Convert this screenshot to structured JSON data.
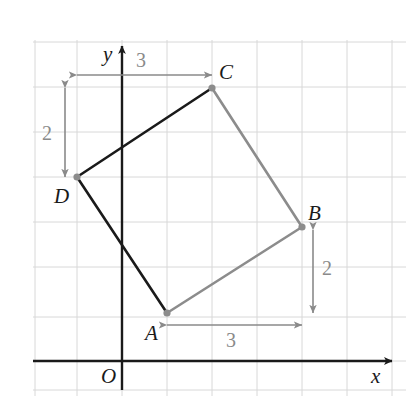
{
  "figure": {
    "background": "#ffffff",
    "width": 406,
    "height": 396
  },
  "axes": {
    "x_label": "x",
    "y_label": "y",
    "origin_label": "O",
    "axis_color": "#1a1a1a",
    "grid_color": "#d8d8d8",
    "origin_px": [
      122,
      361
    ],
    "grid_spacing_px": 45,
    "x_axis_y_px": 361,
    "y_axis_x_px": 122,
    "grid_x_px": [
      35,
      77,
      122,
      167,
      212,
      257,
      302,
      347,
      392
    ],
    "grid_y_px": [
      42,
      87,
      132,
      177,
      222,
      267,
      317,
      361,
      390
    ]
  },
  "chart_data": {
    "type": "scatter",
    "xlabel": "x",
    "ylabel": "y",
    "grid": true,
    "legend": "none",
    "vertices": [
      {
        "name": "A",
        "x": 1,
        "y": 1,
        "px": [
          167,
          313
        ],
        "label_dx": -20,
        "label_dy": 10
      },
      {
        "name": "B",
        "x": 4,
        "y": 3,
        "px": [
          302,
          227
        ],
        "label_dx": 8,
        "label_dy": -26
      },
      {
        "name": "C",
        "x": 2,
        "y": 6,
        "px": [
          212,
          88
        ],
        "label_dx": 8,
        "label_dy": -28
      },
      {
        "name": "D",
        "x": -1,
        "y": 4,
        "px": [
          77,
          177
        ],
        "label_dx": -22,
        "label_dy": 8
      }
    ],
    "edges": [
      {
        "name": "DC",
        "from": "D",
        "to": "C",
        "color": "#1a1a1a",
        "width": 2.6
      },
      {
        "name": "CB",
        "from": "C",
        "to": "B",
        "color": "#8c8c8c",
        "width": 2.6
      },
      {
        "name": "BA",
        "from": "B",
        "to": "A",
        "color": "#8c8c8c",
        "width": 2.6
      },
      {
        "name": "AD",
        "from": "A",
        "to": "D",
        "color": "#1a1a1a",
        "width": 2.6
      }
    ],
    "vertex_marker_color": "#8c8c8c",
    "vertex_marker_radius": 3.6
  },
  "dimensions": [
    {
      "id": "top-horizontal",
      "label": "3",
      "orientation": "horizontal",
      "from_px": [
        77,
        75
      ],
      "to_px": [
        212,
        75
      ],
      "label_px": [
        136,
        50
      ],
      "color": "#8a8a8a"
    },
    {
      "id": "left-vertical",
      "label": "2",
      "orientation": "vertical",
      "from_px": [
        65,
        88
      ],
      "to_px": [
        65,
        177
      ],
      "label_px": [
        42,
        123
      ],
      "color": "#8a8a8a"
    },
    {
      "id": "right-vertical",
      "label": "2",
      "orientation": "vertical",
      "from_px": [
        313,
        230
      ],
      "to_px": [
        313,
        313
      ],
      "label_px": [
        322,
        258
      ],
      "color": "#8a8a8a"
    },
    {
      "id": "bottom-horizontal",
      "label": "3",
      "orientation": "horizontal",
      "from_px": [
        167,
        325
      ],
      "to_px": [
        302,
        325
      ],
      "label_px": [
        226,
        330
      ],
      "color": "#8a8a8a"
    }
  ],
  "point_labels": [
    {
      "id": "label-A",
      "text": "A",
      "px": [
        145,
        323
      ]
    },
    {
      "id": "label-B",
      "text": "B",
      "px": [
        308,
        203
      ]
    },
    {
      "id": "label-C",
      "text": "C",
      "px": [
        219,
        62
      ]
    },
    {
      "id": "label-D",
      "text": "D",
      "px": [
        54,
        186
      ]
    },
    {
      "id": "label-O",
      "text": "O",
      "px": [
        101,
        366
      ]
    },
    {
      "id": "label-x",
      "text": "x",
      "px": [
        371,
        366
      ]
    },
    {
      "id": "label-y",
      "text": "y",
      "px": [
        103,
        44
      ]
    }
  ]
}
